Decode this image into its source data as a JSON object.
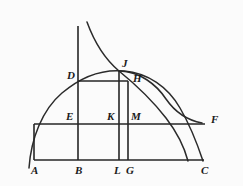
{
  "figure": {
    "background_color": "#fbfbfb",
    "stroke_color": "#262626",
    "label_color": "#1a1a1a",
    "width": 243,
    "height": 186
  },
  "points": [
    {
      "id": "A",
      "label": "A",
      "x": 34,
      "y": 160,
      "label_x": 31,
      "label_y": 174
    },
    {
      "id": "B",
      "label": "B",
      "x": 78,
      "y": 160,
      "label_x": 75,
      "label_y": 174
    },
    {
      "id": "L",
      "label": "L",
      "x": 119,
      "y": 160,
      "label_x": 114,
      "label_y": 174
    },
    {
      "id": "G",
      "label": "G",
      "x": 128,
      "y": 160,
      "label_x": 126,
      "label_y": 174
    },
    {
      "id": "C",
      "label": "C",
      "x": 204,
      "y": 160,
      "label_x": 201,
      "label_y": 174
    },
    {
      "id": "E",
      "label": "E",
      "x": 78,
      "y": 124,
      "label_x": 66,
      "label_y": 120
    },
    {
      "id": "K",
      "label": "K",
      "x": 119,
      "y": 124,
      "label_x": 107,
      "label_y": 120
    },
    {
      "id": "M",
      "label": "M",
      "x": 128,
      "y": 124,
      "label_x": 131,
      "label_y": 120
    },
    {
      "id": "F",
      "label": "F",
      "x": 205,
      "y": 124,
      "label_x": 211,
      "label_y": 123
    },
    {
      "id": "D",
      "label": "D",
      "x": 78,
      "y": 81,
      "label_x": 67,
      "label_y": 79
    },
    {
      "id": "J",
      "label": "J",
      "x": 120,
      "y": 71,
      "label_x": 122,
      "label_y": 67
    },
    {
      "id": "H",
      "label": "H",
      "x": 128,
      "y": 81,
      "label_x": 133,
      "label_y": 82
    }
  ],
  "segments": [
    {
      "name": "baseline-AC",
      "x1": 34,
      "y1": 160,
      "x2": 204,
      "y2": 160,
      "width": 1.6
    },
    {
      "name": "horizontal-EF",
      "x1": 34,
      "y1": 124,
      "x2": 205,
      "y2": 124,
      "width": 1.6
    },
    {
      "name": "rectangle-left-AE",
      "x1": 34,
      "y1": 124,
      "x2": 34,
      "y2": 160,
      "width": 1.6
    },
    {
      "name": "vertical-B-axis",
      "x1": 78,
      "y1": 26,
      "x2": 78,
      "y2": 160,
      "width": 1.6
    },
    {
      "name": "vertical-L-JL",
      "x1": 119,
      "y1": 71,
      "x2": 119,
      "y2": 160,
      "width": 1.6
    },
    {
      "name": "vertical-G-HG",
      "x1": 128,
      "y1": 81,
      "x2": 128,
      "y2": 160,
      "width": 1.6
    },
    {
      "name": "horizontal-DH",
      "x1": 78,
      "y1": 81,
      "x2": 128,
      "y2": 81,
      "width": 1.6
    }
  ],
  "curves": [
    {
      "name": "ellipse-arc-major",
      "description": "Large elliptical arc passing through A-region, D, J and down to C and beyond",
      "path": "M 29 168 C 31 139 42 110 62 93 C 82 76 104 69 124 71 C 148 73 168 87 180 108 C 190 125 197 143 203 161"
    },
    {
      "name": "hyperbola-branch",
      "description": "Descending hyperbola-like branch crossing J and continuing below the EF line",
      "path": "M 87 22 C 95 44 106 60 119 71 C 135 84 152 100 166 118 C 176 131 184 146 188 161"
    },
    {
      "name": "inner-arc-HF",
      "description": "Flatter arc from near J/H sweeping right and down to the F horizontal line",
      "path": "M 120 71 C 140 72 156 84 166 99 C 175 112 186 120 202 123"
    }
  ],
  "labels_note": "Points labelled A, B, L, G, C along the base; E, K, M, F on the middle horizontal; D, J, H on the upper construction."
}
